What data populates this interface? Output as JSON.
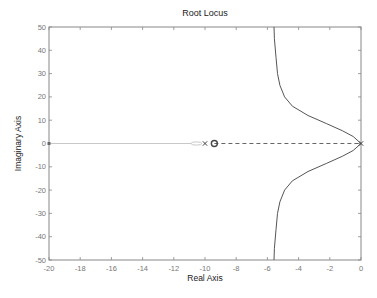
{
  "chart_data": {
    "type": "line",
    "title": "Root Locus",
    "xlabel": "Real Axis",
    "ylabel": "Imaginary Axis",
    "xlim": [
      -20,
      0
    ],
    "ylim": [
      -50,
      50
    ],
    "grid": false,
    "legend": null,
    "xticks": [
      -20,
      -18,
      -16,
      -14,
      -12,
      -10,
      -8,
      -6,
      -4,
      -2,
      0
    ],
    "yticks": [
      50,
      40,
      30,
      20,
      10,
      0,
      -10,
      -20,
      -30,
      -40,
      -50
    ],
    "poles": [
      {
        "re": -10.0,
        "im": 0
      },
      {
        "re": 0,
        "im": 0
      }
    ],
    "zeros": [
      {
        "re": -9.4,
        "im": 0
      }
    ],
    "series": [
      {
        "name": "upper-branch",
        "style": "solid",
        "x": [
          0,
          -0.5,
          -1.2,
          -2.2,
          -3.4,
          -4.4,
          -4.9,
          -5.2,
          -5.35,
          -5.45,
          -5.55,
          -5.58
        ],
        "y": [
          0,
          3,
          5.5,
          8.5,
          12,
          16,
          20,
          25,
          30,
          37,
          45,
          50
        ]
      },
      {
        "name": "lower-branch",
        "style": "solid",
        "x": [
          0,
          -0.5,
          -1.2,
          -2.2,
          -3.4,
          -4.4,
          -4.9,
          -5.2,
          -5.35,
          -5.45,
          -5.55,
          -5.58
        ],
        "y": [
          0,
          -3,
          -5.5,
          -8.5,
          -12,
          -16,
          -20,
          -25,
          -30,
          -37,
          -45,
          -50
        ]
      },
      {
        "name": "real-axis-segment-dashed",
        "style": "dashed",
        "x": [
          -9.4,
          0
        ],
        "y": [
          0,
          0
        ]
      },
      {
        "name": "real-axis-segment-faint",
        "style": "dotted",
        "x": [
          -20,
          -10.9
        ],
        "y": [
          0,
          0
        ]
      },
      {
        "name": "small-loop",
        "style": "faint",
        "x": [
          -10.9,
          -10.2
        ],
        "y": [
          0.5,
          -0.5
        ]
      }
    ]
  }
}
